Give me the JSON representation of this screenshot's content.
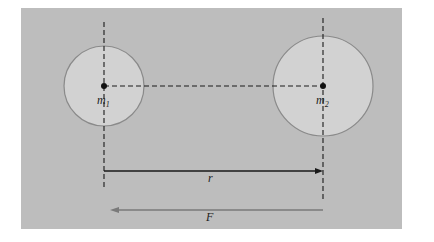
{
  "diagram": {
    "colors": {
      "background": "#ffffff",
      "panel": "#bdbdbd",
      "sphere_fill": "#d2d2d2",
      "sphere_stroke": "#8a8a8a",
      "line": "#1a1a1a",
      "force_arrow": "#7a7a7a"
    },
    "masses": [
      {
        "label": "m",
        "subscript": "1",
        "cx": 104,
        "cy": 86,
        "radius": 40
      },
      {
        "label": "m",
        "subscript": "2",
        "cx": 323,
        "cy": 86,
        "radius": 50
      }
    ],
    "distance_label": "r",
    "force_label": "F"
  }
}
